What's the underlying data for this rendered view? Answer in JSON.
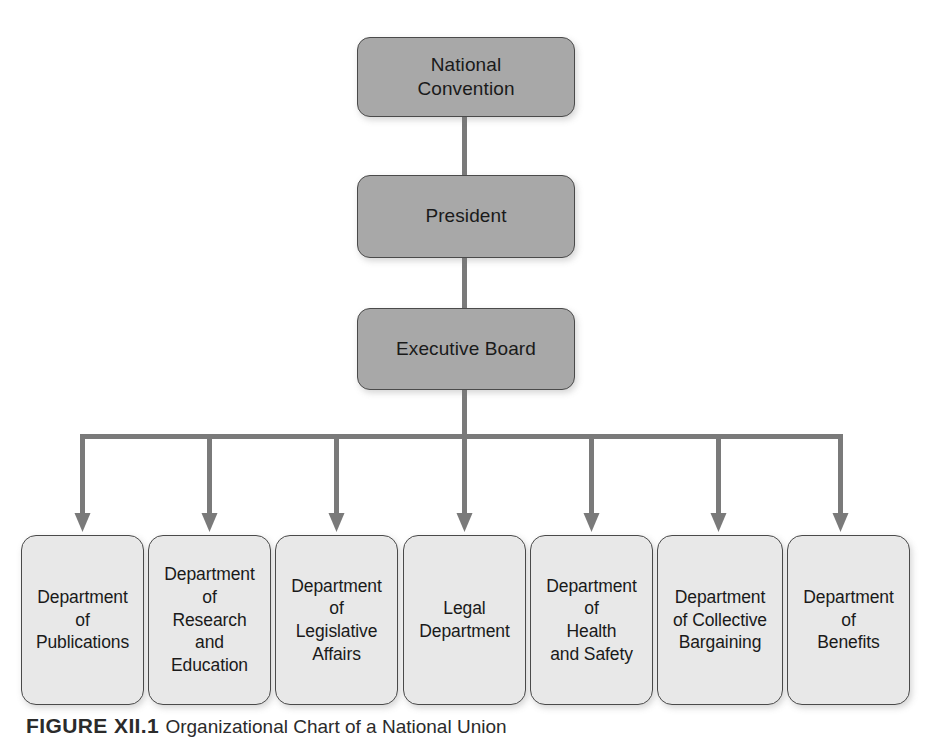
{
  "figure": {
    "caption_label": "FIGURE XII.1",
    "caption_text": "Organizational Chart of a National Union"
  },
  "colors": {
    "top_box_fill": "#a8a8a8",
    "dept_box_fill": "#e8e8e8",
    "box_border": "#4a4a4a",
    "connector": "#7a7a7a",
    "text": "#1a1a1a",
    "background": "#ffffff"
  },
  "hierarchy": {
    "levels": [
      {
        "name": "National Convention",
        "label": "National\nConvention"
      },
      {
        "name": "President",
        "label": "President"
      },
      {
        "name": "Executive Board",
        "label": "Executive Board"
      }
    ],
    "departments": [
      {
        "name": "Department of Publications",
        "label": "Department\nof\nPublications"
      },
      {
        "name": "Department of Research and Education",
        "label": "Department\nof\nResearch\nand\nEducation"
      },
      {
        "name": "Department of Legislative Affairs",
        "label": "Department\nof\nLegislative\nAffairs"
      },
      {
        "name": "Legal Department",
        "label": "Legal\nDepartment"
      },
      {
        "name": "Department of Health and Safety",
        "label": "Department\nof\nHealth\nand Safety"
      },
      {
        "name": "Department of Collective Bargaining",
        "label": "Department\nof Collective\nBargaining"
      },
      {
        "name": "Department of Benefits",
        "label": "Department\nof\nBenefits"
      }
    ]
  }
}
